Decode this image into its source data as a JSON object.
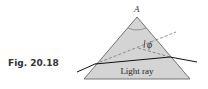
{
  "figure": {
    "caption": "Fig. 20.18",
    "apex_label": "A",
    "angle_label": "ϕ",
    "ray_label": "Light ray"
  },
  "colors": {
    "prism_fill": "#d4d4d4",
    "prism_stroke": "#444444",
    "ray": "#111111",
    "dashed": "#555555",
    "caption": "#333333"
  }
}
